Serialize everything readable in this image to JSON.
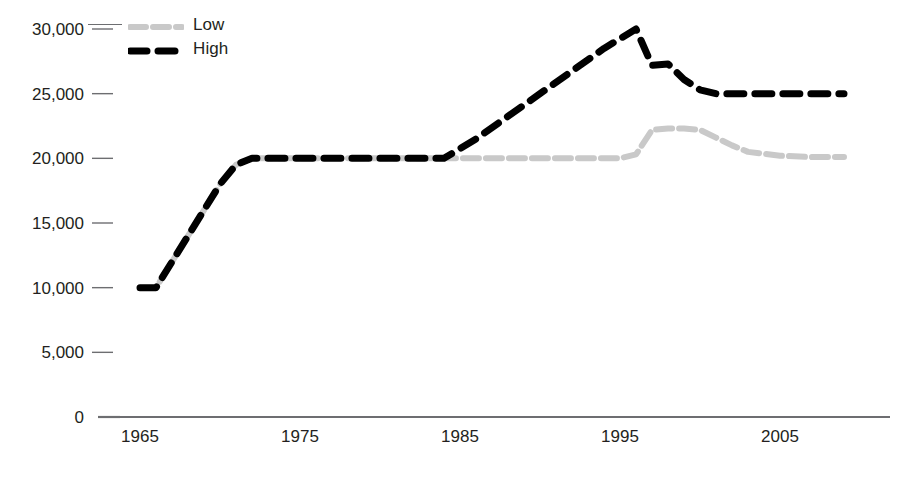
{
  "chart_data": {
    "type": "line",
    "title": "",
    "subtitle": "",
    "xlabel": "",
    "ylabel": "",
    "xlim": [
      1964,
      2010
    ],
    "ylim": [
      0,
      30000
    ],
    "grid": false,
    "legend_position": "top-left",
    "y_ticks": [
      {
        "value": 0,
        "label": "0"
      },
      {
        "value": 5000,
        "label": "5,000"
      },
      {
        "value": 10000,
        "label": "10,000"
      },
      {
        "value": 15000,
        "label": "15,000"
      },
      {
        "value": 20000,
        "label": "20,000"
      },
      {
        "value": 25000,
        "label": "25,000"
      },
      {
        "value": 30000,
        "label": "30,000"
      }
    ],
    "x_ticks": [
      {
        "value": 1965,
        "label": "1965"
      },
      {
        "value": 1975,
        "label": "1975"
      },
      {
        "value": 1985,
        "label": "1985"
      },
      {
        "value": 1995,
        "label": "1995"
      },
      {
        "value": 2005,
        "label": "2005"
      }
    ],
    "series": [
      {
        "name": "Low",
        "color": "#c9c9c9",
        "style": "dotted-hatched",
        "x": [
          1965,
          1966,
          1967,
          1968,
          1969,
          1970,
          1971,
          1972,
          1973,
          1974,
          1975,
          1980,
          1984,
          1986,
          1990,
          1994,
          1995,
          1996,
          1997,
          1998,
          1999,
          2000,
          2001,
          2002,
          2003,
          2005,
          2007,
          2009
        ],
        "values": [
          10000,
          10000,
          12000,
          14000,
          16000,
          18000,
          19500,
          20000,
          20000,
          20000,
          20000,
          20000,
          20000,
          20000,
          20000,
          20000,
          20000,
          20300,
          22200,
          22300,
          22300,
          22200,
          21600,
          21000,
          20500,
          20200,
          20100,
          20100
        ]
      },
      {
        "name": "High",
        "color": "#000000",
        "style": "dashed-bold",
        "x": [
          1965,
          1966,
          1967,
          1968,
          1969,
          1970,
          1971,
          1972,
          1973,
          1974,
          1975,
          1980,
          1984,
          1986,
          1990,
          1994,
          1996,
          1997,
          1998,
          1999,
          2000,
          2001,
          2003,
          2005,
          2007,
          2009
        ],
        "values": [
          10000,
          10000,
          12000,
          14000,
          16000,
          18000,
          19500,
          20000,
          20000,
          20000,
          20000,
          20000,
          20000,
          21500,
          25000,
          28500,
          30000,
          27200,
          27300,
          26100,
          25300,
          25000,
          25000,
          25000,
          25000,
          25000
        ]
      }
    ],
    "annotations": []
  },
  "legend": {
    "items": [
      {
        "label": "Low",
        "marker": "low-series-marker"
      },
      {
        "label": "High",
        "marker": "high-series-marker"
      }
    ]
  }
}
